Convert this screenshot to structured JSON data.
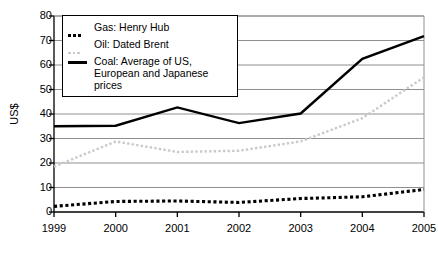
{
  "chart_data": {
    "type": "line",
    "title": "",
    "xlabel": "",
    "ylabel": "US$",
    "categories": [
      "1999",
      "2000",
      "2001",
      "2002",
      "2003",
      "2004",
      "2005"
    ],
    "x": [
      1999,
      2000,
      2001,
      2002,
      2003,
      2004,
      2005
    ],
    "xlim": [
      1999,
      2005
    ],
    "ylim": [
      0,
      80
    ],
    "y_ticks": [
      0,
      10,
      20,
      30,
      40,
      50,
      60,
      70,
      80
    ],
    "x_ticks": [
      "1999",
      "2000",
      "2001",
      "2002",
      "2003",
      "2004",
      "2005"
    ],
    "grid": "horizontal",
    "legend_position": "top-left",
    "series": [
      {
        "name": "Gas: Henry Hub",
        "style": "dotted",
        "color": "#000000",
        "values": [
          2.3,
          4.3,
          4.5,
          3.9,
          5.5,
          6.2,
          9.2
        ]
      },
      {
        "name": "Oil: Dated Brent",
        "style": "dotted-light",
        "color": "#c9c9c9",
        "values": [
          18.5,
          28.8,
          24.5,
          25.0,
          28.8,
          38.3,
          55.0
        ]
      },
      {
        "name": "Coal: Average of US,\nEuropean and Japanese prices",
        "style": "solid",
        "color": "#000000",
        "values": [
          35.0,
          35.2,
          42.7,
          36.3,
          40.2,
          62.5,
          71.8
        ]
      }
    ]
  },
  "axis": {
    "y_title": "US$",
    "y_tick_labels": [
      "80",
      "70",
      "60",
      "50",
      "40",
      "30",
      "20",
      "10",
      "0"
    ],
    "x_tick_labels": [
      "1999",
      "2000",
      "2001",
      "2002",
      "2003",
      "2004",
      "2005"
    ]
  },
  "legend": {
    "items": [
      {
        "label": "Gas: Henry Hub",
        "marker": "dotted-marker"
      },
      {
        "label": "Oil: Dated Brent",
        "marker": "dotted-light-marker"
      },
      {
        "label": "Coal: Average of US,\nEuropean and Japanese prices",
        "marker": "solid-line-marker"
      }
    ]
  }
}
